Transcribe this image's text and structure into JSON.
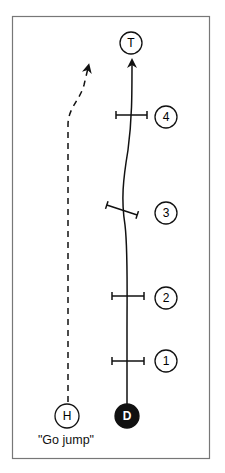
{
  "diagram": {
    "frame": {
      "x": 12,
      "y": 16,
      "w": 197,
      "h": 442,
      "stroke": "#777777"
    },
    "nodes": {
      "target": {
        "label": "T",
        "x": 131,
        "y": 43,
        "r": 11,
        "filled": false
      },
      "driver": {
        "label": "D",
        "x": 127,
        "y": 416,
        "r": 12,
        "filled": true
      },
      "helper": {
        "label": "H",
        "x": 67,
        "y": 416,
        "r": 12,
        "filled": false
      }
    },
    "markers": [
      {
        "label": "1",
        "x": 166,
        "y": 361
      },
      {
        "label": "2",
        "x": 166,
        "y": 298
      },
      {
        "label": "3",
        "x": 166,
        "y": 213
      },
      {
        "label": "4",
        "x": 166,
        "y": 117
      }
    ],
    "caption": "\"Go jump\"",
    "colors": {
      "ink": "#111111",
      "fill": "#ffffff"
    }
  }
}
